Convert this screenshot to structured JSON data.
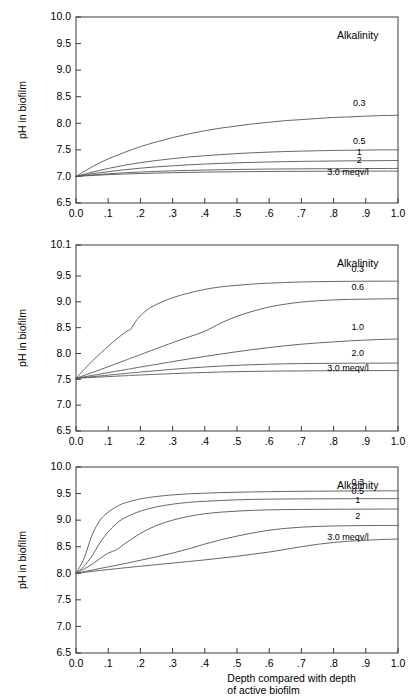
{
  "figure": {
    "background": "#ffffff",
    "line_color": "#555555",
    "axis_color": "#3a3a3a",
    "text_color": "#000000"
  },
  "chart_data": [
    {
      "type": "line",
      "panel": "top",
      "title": "",
      "xlabel": "",
      "ylabel": "pH in biofilm",
      "xlim": [
        0.0,
        1.0
      ],
      "ylim": [
        6.5,
        10.0
      ],
      "grid": false,
      "legend_position": "right-inside",
      "legend_title": "Alkalinity",
      "legend_unit": "meqv/l",
      "xticks": [
        0.0,
        0.1,
        0.2,
        0.3,
        0.4,
        0.5,
        0.6,
        0.7,
        0.8,
        0.9,
        1.0
      ],
      "xticklabels": [
        "0.0",
        ".1",
        ".2",
        ".3",
        ".4",
        ".5",
        ".6",
        ".7",
        ".8",
        ".9",
        "1.0"
      ],
      "yticks": [
        6.5,
        7.0,
        7.5,
        8.0,
        8.5,
        9.0,
        9.5,
        10.0
      ],
      "yticklabels": [
        "6.5",
        "7.0",
        "7.5",
        "8.0",
        "8.5",
        "9.0",
        "9.5",
        "10.0"
      ],
      "x": [
        0.0,
        0.05,
        0.1,
        0.15,
        0.2,
        0.25,
        0.3,
        0.35,
        0.4,
        0.45,
        0.5,
        0.55,
        0.6,
        0.65,
        0.7,
        0.75,
        0.8,
        0.85,
        0.9,
        0.95,
        1.0
      ],
      "series": [
        {
          "name": "0.3",
          "label": "0.3",
          "label_x": 0.88,
          "label_y": 8.32,
          "values": [
            7.0,
            7.18,
            7.33,
            7.45,
            7.56,
            7.65,
            7.73,
            7.8,
            7.86,
            7.91,
            7.95,
            7.99,
            8.02,
            8.05,
            8.07,
            8.09,
            8.11,
            8.12,
            8.135,
            8.145,
            8.15
          ]
        },
        {
          "name": "0.5",
          "label": "0.5",
          "label_x": 0.88,
          "label_y": 7.61,
          "values": [
            7.0,
            7.08,
            7.15,
            7.21,
            7.26,
            7.3,
            7.335,
            7.365,
            7.39,
            7.41,
            7.43,
            7.445,
            7.458,
            7.468,
            7.476,
            7.483,
            7.489,
            7.493,
            7.496,
            7.499,
            7.5
          ]
        },
        {
          "name": "1",
          "label": "1",
          "label_x": 0.88,
          "label_y": 7.4,
          "values": [
            7.0,
            7.05,
            7.09,
            7.125,
            7.155,
            7.18,
            7.2,
            7.218,
            7.233,
            7.246,
            7.256,
            7.265,
            7.272,
            7.278,
            7.283,
            7.287,
            7.29,
            7.293,
            7.295,
            7.297,
            7.3
          ]
        },
        {
          "name": "2",
          "label": "2",
          "label_x": 0.88,
          "label_y": 7.245,
          "values": [
            7.0,
            7.028,
            7.05,
            7.068,
            7.083,
            7.095,
            7.105,
            7.113,
            7.12,
            7.126,
            7.131,
            7.135,
            7.138,
            7.141,
            7.143,
            7.145,
            7.146,
            7.147,
            7.148,
            7.149,
            7.15
          ]
        },
        {
          "name": "3.0",
          "label": "3.0  meqv/l",
          "label_x": 0.845,
          "label_y": 7.02,
          "values": [
            7.0,
            7.018,
            7.033,
            7.045,
            7.055,
            7.063,
            7.07,
            7.076,
            7.081,
            7.085,
            7.088,
            7.091,
            7.093,
            7.095,
            7.096,
            7.097,
            7.098,
            7.099,
            7.0995,
            7.0998,
            7.1
          ]
        }
      ]
    },
    {
      "type": "line",
      "panel": "middle",
      "title": "",
      "xlabel": "",
      "ylabel": "pH in biofilm",
      "xlim": [
        0.0,
        1.0
      ],
      "ylim": [
        6.5,
        10.1
      ],
      "grid": false,
      "legend_position": "right-inside",
      "legend_title": "Alkalinity",
      "legend_unit": "meqv/l",
      "xticks": [
        0.0,
        0.1,
        0.2,
        0.3,
        0.4,
        0.5,
        0.6,
        0.7,
        0.8,
        0.9,
        1.0
      ],
      "xticklabels": [
        "0.0",
        ".1",
        ".2",
        ".3",
        ".4",
        ".5",
        ".6",
        ".7",
        ".8",
        ".9",
        "1.0"
      ],
      "yticks": [
        6.5,
        7.0,
        7.5,
        8.0,
        8.5,
        9.0,
        9.5,
        10.1
      ],
      "yticklabels": [
        "6.5",
        "7.0",
        "7.5",
        "8.0",
        "8.5",
        "9.0",
        "9.5",
        "10.1"
      ],
      "x": [
        0.0,
        0.05,
        0.1,
        0.13,
        0.16,
        0.17,
        0.19,
        0.22,
        0.25,
        0.3,
        0.35,
        0.4,
        0.45,
        0.5,
        0.55,
        0.6,
        0.65,
        0.7,
        0.75,
        0.8,
        0.85,
        0.9,
        0.95,
        1.0
      ],
      "series": [
        {
          "name": "0.3",
          "label": "0.3",
          "label_x": 0.875,
          "label_y": 9.58,
          "values": [
            7.52,
            7.85,
            8.14,
            8.3,
            8.44,
            8.47,
            8.66,
            8.84,
            8.95,
            9.08,
            9.17,
            9.24,
            9.29,
            9.32,
            9.345,
            9.362,
            9.375,
            9.384,
            9.39,
            9.394,
            9.397,
            9.399,
            9.4,
            9.4
          ]
        },
        {
          "name": "0.6",
          "label": "0.6",
          "label_x": 0.875,
          "label_y": 9.22,
          "values": [
            7.52,
            7.63,
            7.745,
            7.815,
            7.885,
            7.91,
            7.955,
            8.025,
            8.095,
            8.21,
            8.32,
            8.43,
            8.59,
            8.72,
            8.82,
            8.9,
            8.955,
            8.995,
            9.02,
            9.037,
            9.047,
            9.053,
            9.057,
            9.06
          ]
        },
        {
          "name": "1.0",
          "label": "1.0",
          "label_x": 0.875,
          "label_y": 8.45,
          "values": [
            7.52,
            7.575,
            7.63,
            7.662,
            7.694,
            7.705,
            7.727,
            7.759,
            7.79,
            7.843,
            7.894,
            7.943,
            7.99,
            8.035,
            8.077,
            8.115,
            8.15,
            8.18,
            8.205,
            8.225,
            8.245,
            8.26,
            8.272,
            8.28
          ]
        },
        {
          "name": "2.0",
          "label": "2.0",
          "label_x": 0.875,
          "label_y": 7.95,
          "values": [
            7.52,
            7.551,
            7.581,
            7.599,
            7.617,
            7.623,
            7.635,
            7.652,
            7.668,
            7.694,
            7.718,
            7.739,
            7.757,
            7.772,
            7.784,
            7.793,
            7.8,
            7.805,
            7.808,
            7.81,
            7.812,
            7.813,
            7.814,
            7.815
          ]
        },
        {
          "name": "3.0",
          "label": "3.0  meqv/l",
          "label_x": 0.845,
          "label_y": 7.66,
          "values": [
            7.52,
            7.537,
            7.553,
            7.563,
            7.572,
            7.575,
            7.581,
            7.59,
            7.598,
            7.611,
            7.623,
            7.633,
            7.642,
            7.649,
            7.654,
            7.658,
            7.661,
            7.663,
            7.665,
            7.666,
            7.667,
            7.668,
            7.669,
            7.67
          ]
        }
      ]
    },
    {
      "type": "line",
      "panel": "bottom",
      "title": "",
      "xlabel": "Depth compared with depth of active biofilm",
      "xlabel_line1": "Depth compared with depth",
      "xlabel_line2": "of active biofilm",
      "ylabel": "pH in biofilm",
      "xlim": [
        0.0,
        1.0
      ],
      "ylim": [
        6.5,
        10.0
      ],
      "grid": false,
      "legend_position": "right-inside",
      "legend_title": "Alkalinity",
      "legend_unit": "meqv/l",
      "xticks": [
        0.0,
        0.1,
        0.2,
        0.3,
        0.4,
        0.5,
        0.6,
        0.7,
        0.8,
        0.9,
        1.0
      ],
      "xticklabels": [
        "0.0",
        ".1",
        ".2",
        ".3",
        ".4",
        ".5",
        ".6",
        ".7",
        ".8",
        ".9",
        "1.0"
      ],
      "yticks": [
        6.5,
        7.0,
        7.5,
        8.0,
        8.5,
        9.0,
        9.5,
        10.0
      ],
      "yticklabels": [
        "6.5",
        "7.0",
        "7.5",
        "8.0",
        "8.5",
        "9.0",
        "9.5",
        "10.0"
      ],
      "x": [
        0.0,
        0.025,
        0.05,
        0.075,
        0.1,
        0.125,
        0.15,
        0.2,
        0.25,
        0.3,
        0.35,
        0.4,
        0.45,
        0.5,
        0.55,
        0.6,
        0.65,
        0.7,
        0.75,
        0.8,
        0.85,
        0.9,
        0.95,
        1.0
      ],
      "series": [
        {
          "name": "0.3",
          "label": "0.3",
          "label_x": 0.875,
          "label_y": 9.66,
          "values": [
            8.0,
            8.28,
            8.72,
            9.0,
            9.15,
            9.25,
            9.32,
            9.4,
            9.445,
            9.475,
            9.495,
            9.508,
            9.518,
            9.525,
            9.531,
            9.536,
            9.54,
            9.543,
            9.545,
            9.547,
            9.549,
            9.55,
            9.551,
            9.552
          ]
        },
        {
          "name": "0.5",
          "label": "0.5",
          "label_x": 0.875,
          "label_y": 9.49,
          "values": [
            8.0,
            8.13,
            8.33,
            8.58,
            8.78,
            8.93,
            9.04,
            9.17,
            9.25,
            9.3,
            9.335,
            9.355,
            9.37,
            9.382,
            9.39,
            9.395,
            9.398,
            9.4,
            9.401,
            9.402,
            9.403,
            9.404,
            9.404,
            9.405
          ]
        },
        {
          "name": "1",
          "label": "1",
          "label_x": 0.875,
          "label_y": 9.32,
          "values": [
            8.0,
            8.08,
            8.17,
            8.28,
            8.38,
            8.44,
            8.55,
            8.75,
            8.9,
            9.0,
            9.07,
            9.12,
            9.15,
            9.17,
            9.185,
            9.193,
            9.198,
            9.201,
            9.203,
            9.205,
            9.206,
            9.207,
            9.208,
            9.21
          ]
        },
        {
          "name": "2",
          "label": "2",
          "label_x": 0.875,
          "label_y": 9.02,
          "values": [
            8.0,
            8.03,
            8.06,
            8.09,
            8.12,
            8.15,
            8.18,
            8.245,
            8.31,
            8.38,
            8.46,
            8.55,
            8.63,
            8.7,
            8.76,
            8.81,
            8.845,
            8.868,
            8.882,
            8.89,
            8.895,
            8.898,
            8.9,
            8.9
          ]
        },
        {
          "name": "3.0",
          "label": "3.0  meqv/l",
          "label_x": 0.845,
          "label_y": 8.62,
          "values": [
            8.0,
            8.018,
            8.036,
            8.053,
            8.07,
            8.086,
            8.102,
            8.133,
            8.163,
            8.192,
            8.222,
            8.252,
            8.285,
            8.32,
            8.36,
            8.4,
            8.45,
            8.5,
            8.545,
            8.58,
            8.605,
            8.622,
            8.635,
            8.645
          ]
        }
      ]
    }
  ]
}
